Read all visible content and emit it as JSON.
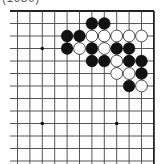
{
  "caption": "(1980)",
  "colors": {
    "background": "#ffffff",
    "grid_line": "#444444",
    "edge_line": "#222222",
    "black_stone": "#111111",
    "white_stone_fill": "#ffffff",
    "white_stone_stroke": "#222222",
    "hoshi": "#111111"
  },
  "board": {
    "visible_columns": 12,
    "visible_rows": 13,
    "edges_shown": [
      "top",
      "right"
    ],
    "grid_origin_x": 17.5,
    "grid_origin_y": 11,
    "spacing_x": 12.4,
    "spacing_y": 12.5
  },
  "hoshi_points": [
    {
      "col": 2,
      "row": 3
    },
    {
      "col": 2,
      "row": 9
    },
    {
      "col": 8,
      "row": 9
    }
  ],
  "stones": [
    {
      "color": "black",
      "col": 6,
      "row": 1
    },
    {
      "color": "black",
      "col": 7,
      "row": 1
    },
    {
      "color": "black",
      "col": 4,
      "row": 2
    },
    {
      "color": "black",
      "col": 5,
      "row": 2
    },
    {
      "color": "white",
      "col": 6,
      "row": 2
    },
    {
      "color": "white",
      "col": 7,
      "row": 2
    },
    {
      "color": "white",
      "col": 8,
      "row": 2
    },
    {
      "color": "white",
      "col": 9,
      "row": 2
    },
    {
      "color": "white",
      "col": 10,
      "row": 2
    },
    {
      "color": "black",
      "col": 4,
      "row": 3
    },
    {
      "color": "white",
      "col": 5,
      "row": 3
    },
    {
      "color": "black",
      "col": 6,
      "row": 3
    },
    {
      "color": "white",
      "col": 7,
      "row": 3
    },
    {
      "color": "black",
      "col": 8,
      "row": 3
    },
    {
      "color": "black",
      "col": 9,
      "row": 3
    },
    {
      "color": "black",
      "col": 6,
      "row": 4
    },
    {
      "color": "black",
      "col": 7,
      "row": 4
    },
    {
      "color": "white",
      "col": 8,
      "row": 4
    },
    {
      "color": "black",
      "col": 9,
      "row": 4
    },
    {
      "color": "black",
      "col": 10,
      "row": 4
    },
    {
      "color": "white",
      "col": 8,
      "row": 5
    },
    {
      "color": "white",
      "col": 9,
      "row": 5
    },
    {
      "color": "black",
      "col": 10,
      "row": 5
    },
    {
      "color": "black",
      "col": 9,
      "row": 6
    },
    {
      "color": "white",
      "col": 10,
      "row": 6
    }
  ]
}
